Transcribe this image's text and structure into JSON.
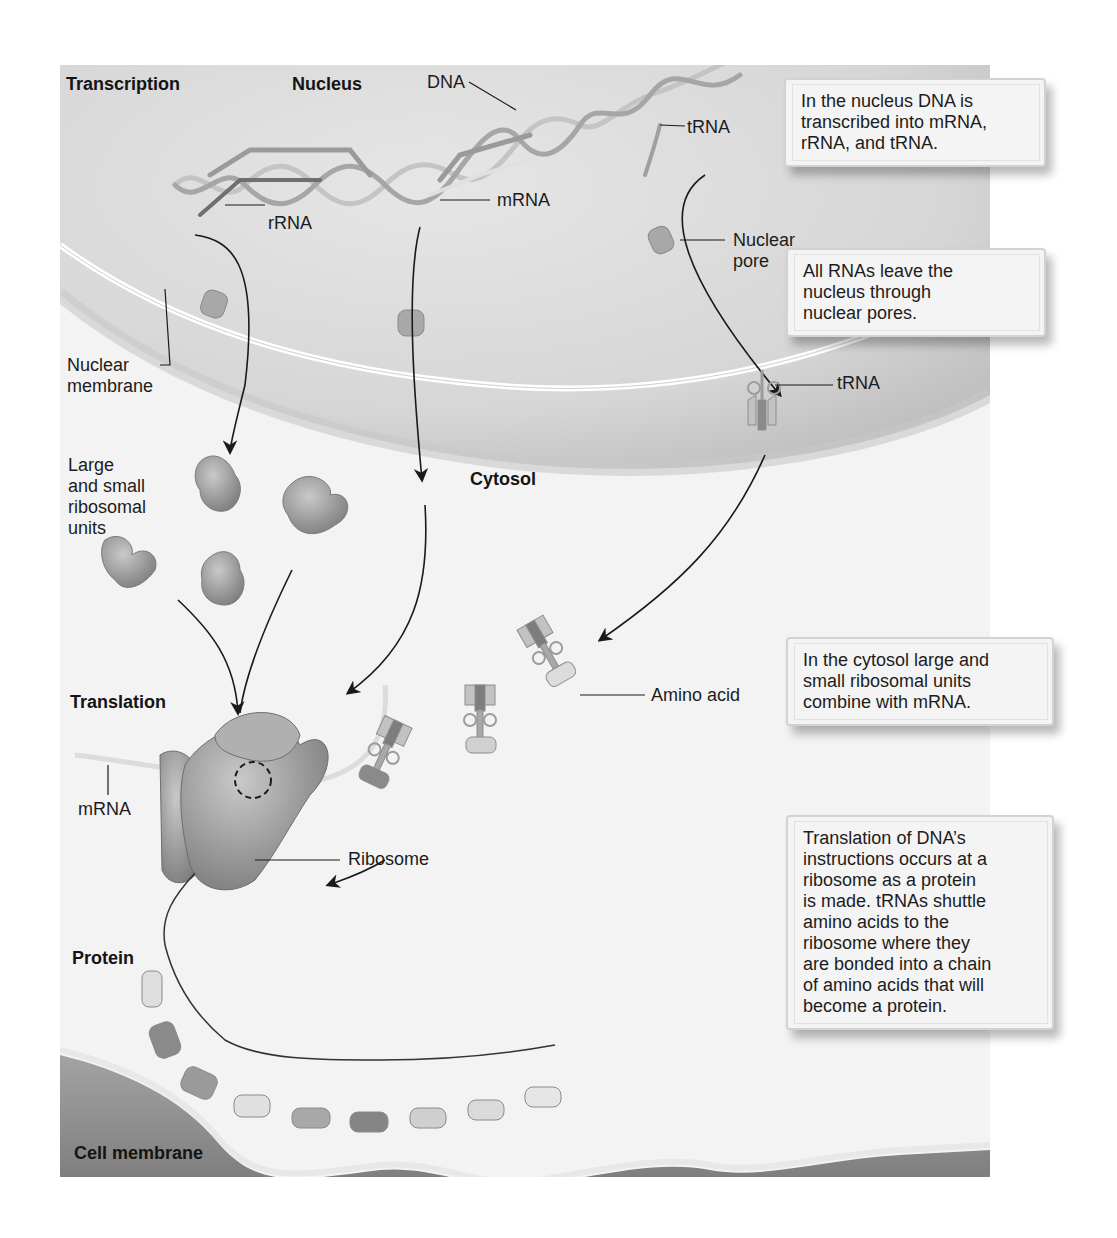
{
  "section_headers": {
    "transcription": "Transcription",
    "nucleus": "Nucleus",
    "cytosol": "Cytosol",
    "translation": "Translation",
    "protein": "Protein",
    "cell_membrane": "Cell membrane"
  },
  "labels": {
    "dna": "DNA",
    "trna_nucleus": "tRNA",
    "rrna": "rRNA",
    "mrna_nucleus": "mRNA",
    "nuclear_pore": [
      "Nuclear",
      "pore"
    ],
    "nuclear_membrane": [
      "Nuclear",
      "membrane"
    ],
    "trna_cytosol": "tRNA",
    "ribosomal_units": [
      "Large",
      "and small",
      "ribosomal",
      "units"
    ],
    "amino_acid": "Amino acid",
    "mrna_translation": "mRNA",
    "ribosome": "Ribosome"
  },
  "callouts": [
    {
      "id": "transcription",
      "lines": [
        "In the nucleus DNA is",
        "transcribed into mRNA,",
        "rRNA, and tRNA."
      ]
    },
    {
      "id": "nuclear-pores",
      "lines": [
        "All RNAs leave the",
        "nucleus through",
        "nuclear pores."
      ]
    },
    {
      "id": "cytosol-combine",
      "lines": [
        "In the cytosol large and",
        "small ribosomal units",
        "combine with mRNA."
      ]
    },
    {
      "id": "translation",
      "lines": [
        "Translation of DNA’s",
        "instructions occurs at a",
        "ribosome as a protein",
        "is made. tRNAs shuttle",
        "amino acids to the",
        "ribosome where they",
        "are bonded into a chain",
        "of amino acids that will",
        "become a protein."
      ]
    }
  ],
  "colors": {
    "nucleus_fill": "#dcdcdc",
    "cytosol_fill": "#f3f3f3",
    "membrane_fill": "#8f8f8f",
    "ribosome_fill": "#9a9a9a",
    "trna_fill": "#b8b8b8",
    "amino_light": "#dedede",
    "amino_dark": "#8a8a8a",
    "callout_bg": "#f4f4f4"
  }
}
